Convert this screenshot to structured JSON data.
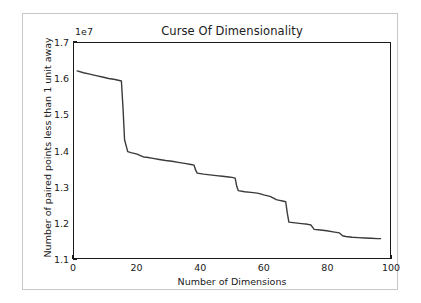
{
  "figure": {
    "background": "#ffffff",
    "border_color": "#c8c8c8",
    "line_color": "#3a3a3a",
    "axis_color": "#1a1a1a"
  },
  "chart_data": {
    "type": "line",
    "title": "Curse Of Dimensionality",
    "xlabel": "Number of Dimensions",
    "ylabel": "Number of paired points less than 1 unit away",
    "offset_text": "1e7",
    "y_scale_exponent": 10000000.0,
    "xlim": [
      0,
      100
    ],
    "ylim": [
      1.1,
      1.7
    ],
    "xticks": [
      0,
      20,
      40,
      60,
      80,
      100
    ],
    "xticklabels": [
      "0",
      "20",
      "40",
      "60",
      "80",
      "100"
    ],
    "yticks": [
      1.1,
      1.2,
      1.3,
      1.4,
      1.5,
      1.6,
      1.7
    ],
    "yticklabels": [
      "1.1",
      "1.2",
      "1.3",
      "1.4",
      "1.5",
      "1.6",
      "1.7"
    ],
    "grid": false,
    "legend": null,
    "series": [
      {
        "name": "paired points within 1 unit",
        "x": [
          1,
          3,
          5,
          7,
          9,
          11,
          13,
          14,
          15,
          15.5,
          16,
          17,
          18,
          19,
          20,
          21,
          22,
          23,
          25,
          27,
          29,
          31,
          33,
          35,
          37,
          38,
          38.5,
          39,
          41,
          43,
          45,
          47,
          49,
          50,
          51,
          51.5,
          52,
          54,
          56,
          58,
          59,
          60,
          61,
          62,
          63,
          64,
          65,
          66,
          67,
          67.5,
          68,
          70,
          72,
          74,
          75,
          76,
          78,
          80,
          82,
          84,
          85,
          86,
          88,
          90,
          92,
          94,
          96,
          97
        ],
        "y": [
          1.622,
          1.617,
          1.613,
          1.609,
          1.605,
          1.601,
          1.598,
          1.596,
          1.594,
          1.52,
          1.43,
          1.397,
          1.394,
          1.392,
          1.39,
          1.386,
          1.382,
          1.381,
          1.378,
          1.375,
          1.372,
          1.37,
          1.367,
          1.364,
          1.361,
          1.359,
          1.345,
          1.337,
          1.334,
          1.332,
          1.33,
          1.328,
          1.326,
          1.325,
          1.323,
          1.3,
          1.288,
          1.285,
          1.283,
          1.281,
          1.279,
          1.276,
          1.274,
          1.272,
          1.268,
          1.263,
          1.261,
          1.259,
          1.257,
          1.225,
          1.2,
          1.198,
          1.196,
          1.194,
          1.192,
          1.18,
          1.178,
          1.176,
          1.173,
          1.17,
          1.162,
          1.16,
          1.158,
          1.157,
          1.156,
          1.155,
          1.154,
          1.154
        ]
      }
    ]
  }
}
